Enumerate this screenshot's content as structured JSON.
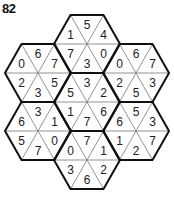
{
  "puzzle": {
    "number": "82",
    "colors": {
      "background": "#ffffff",
      "outline": "#111111",
      "inner_line": "#777777",
      "text": "#222222"
    },
    "geometry": {
      "side": 33,
      "half_height": 29
    },
    "hexagons": [
      {
        "id": "top",
        "center": [
          87,
          44
        ],
        "values": {
          "top": "5",
          "upper_right": "4",
          "lower_right": "0",
          "bottom": "3",
          "lower_left": "7",
          "upper_left": "1"
        }
      },
      {
        "id": "upper-left",
        "center": [
          38,
          73
        ],
        "values": {
          "top": "6",
          "upper_right": "7",
          "lower_right": "5",
          "bottom": "3",
          "lower_left": "2",
          "upper_left": "0"
        }
      },
      {
        "id": "upper-right",
        "center": [
          136,
          73
        ],
        "values": {
          "top": "6",
          "upper_right": "7",
          "lower_right": "3",
          "bottom": "5",
          "lower_left": "2",
          "upper_left": "0"
        }
      },
      {
        "id": "center",
        "center": [
          87,
          102
        ],
        "values": {
          "top": "3",
          "upper_right": "2",
          "lower_right": "6",
          "bottom": "7",
          "lower_left": "1",
          "upper_left": "5"
        }
      },
      {
        "id": "lower-left",
        "center": [
          38,
          131
        ],
        "values": {
          "top": "3",
          "upper_right": "1",
          "lower_right": "0",
          "bottom": "7",
          "lower_left": "5",
          "upper_left": "6"
        }
      },
      {
        "id": "lower-right",
        "center": [
          136,
          131
        ],
        "values": {
          "top": "5",
          "upper_right": "3",
          "lower_right": "7",
          "bottom": "2",
          "lower_left": "1",
          "upper_left": "6"
        }
      },
      {
        "id": "bottom",
        "center": [
          87,
          160
        ],
        "values": {
          "top": "7",
          "upper_right": "1",
          "lower_right": "2",
          "bottom": "6",
          "lower_left": "3",
          "upper_left": "0"
        }
      }
    ]
  }
}
